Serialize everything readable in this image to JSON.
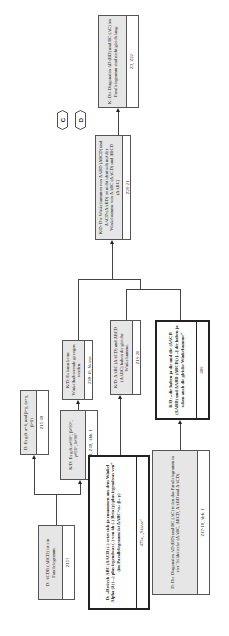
{
  "diagram": {
    "orientation": "rotated 90 degrees counter-clockwise",
    "markers": [
      {
        "id": "marker-c",
        "label": "C"
      },
      {
        "id": "marker-d",
        "label": "D"
      }
    ],
    "nodes": {
      "k_diagonalen": {
        "text": "K: Die Diagonalen AD (BD) und BC (AC) im Parallelogramm sind nicht gleich lang.",
        "ref": "Z3, Z22"
      },
      "kd_winkelsummen": {
        "text": "K/D: Die Winkelsummen von ΔABD (ΔBCD) und ΔACD (ΔABD) ist nicht identisch mit der Winkelsumme von ΔABC (ΔACD) und ΔBCD (ΔABC)",
        "ref": "Z20-21"
      },
      "kd_keine_winkelhalbierende": {
        "text": "K/D: Es kann keine Winkelhalbierende gezogen werden.",
        "ref": "Z18-19, Skizze"
      },
      "kd_gleiche_winkelsumme": {
        "text": "K/D: ΔABC (ΔACD) und ΔBCD (ΔABC) haben die gleiche Winkelsumme.",
        "ref": "Z19-20"
      },
      "kd_die_haben_ja": {
        "text": "K/D: „die haben ja die und die (ΔACD (ΔABD) und ΔABD (ΔBCD)) [...] die haben ja schon auch die gleiche Winkelsumme“",
        "ref": "489"
      },
      "d_es_gilt_gleich": {
        "text": "D: Es gilt α=δ, und β=γ, (α+γ, β=δ)",
        "ref": "Z15-18"
      },
      "kd_es_gilt_ungleich_90": {
        "text": "K/D: Es gilt α≠90°, β≠90°, γ≠90°, δ≠90°",
        "ref": "Z14, Z18, Abb. 1"
      },
      "d_parallelogramm": {
        "text": "D: ACDB (ABCD) ist ein Parallelogramm.",
        "ref": "Z15?"
      },
      "d_dreieck_abc": {
        "text": "D: „Dreieck ABC (ΔACD) (-) setzt sich ja zusammen aus dem Winkel Alpha (δ) (...) plus irgendwas (-) von äh (-) Beta (γ) plus irgendwas von“ (im Parallelogramm ist ΔABC=α+ β+ γ)",
        "ref": "475a, „Skizze“"
      },
      "d_diagonalen_teilen": {
        "text": "D: Die Diagonalen AD (BD) und BC (AC) teilen das Parallelogramm in vier Teildreiecke (ΔABC, ΔBCD, ΔABD und ΔACD).",
        "ref": "Z17-18, Abb. 1"
      }
    }
  }
}
